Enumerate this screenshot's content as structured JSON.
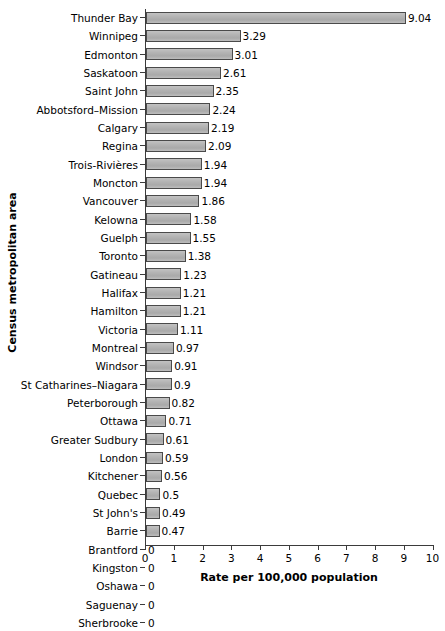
{
  "chart_data": {
    "type": "bar",
    "orientation": "horizontal",
    "title": "",
    "xlabel": "Rate per 100,000 population",
    "ylabel": "Census metropolitan area",
    "xlim": [
      0,
      10
    ],
    "xticks": [
      0,
      1,
      2,
      3,
      4,
      5,
      6,
      7,
      8,
      9,
      10
    ],
    "xtick_labels": [
      "0",
      "1",
      "2",
      "3",
      "4",
      "5",
      "6",
      "7",
      "8",
      "9",
      "10"
    ],
    "grid": false,
    "legend": null,
    "bar_color": "#b0b0b0",
    "bar_edge_color": "#4a4a4a",
    "categories": [
      "Thunder Bay",
      "Winnipeg",
      "Edmonton",
      "Saskatoon",
      "Saint John",
      "Abbotsford–Mission",
      "Calgary",
      "Regina",
      "Trois-Rivières",
      "Moncton",
      "Vancouver",
      "Kelowna",
      "Guelph",
      "Toronto",
      "Gatineau",
      "Halifax",
      "Hamilton",
      "Victoria",
      "Montreal",
      "Windsor",
      "St Catharines–Niagara",
      "Peterborough",
      "Ottawa",
      "Greater Sudbury",
      "London",
      "Kitchener",
      "Quebec",
      "St John's",
      "Barrie",
      "Brantford",
      "Kingston",
      "Oshawa",
      "Saguenay",
      "Sherbrooke"
    ],
    "values": [
      9.04,
      3.29,
      3.01,
      2.61,
      2.35,
      2.24,
      2.19,
      2.09,
      1.94,
      1.94,
      1.86,
      1.58,
      1.55,
      1.38,
      1.23,
      1.21,
      1.21,
      1.11,
      0.97,
      0.91,
      0.9,
      0.82,
      0.71,
      0.61,
      0.59,
      0.56,
      0.5,
      0.49,
      0.47,
      0,
      0,
      0,
      0,
      0
    ],
    "value_labels": [
      "9.04",
      "3.29",
      "3.01",
      "2.61",
      "2.35",
      "2.24",
      "2.19",
      "2.09",
      "1.94",
      "1.94",
      "1.86",
      "1.58",
      "1.55",
      "1.38",
      "1.23",
      "1.21",
      "1.21",
      "1.11",
      "0.97",
      "0.91",
      "0.9",
      "0.82",
      "0.71",
      "0.61",
      "0.59",
      "0.56",
      "0.5",
      "0.49",
      "0.47",
      "0",
      "0",
      "0",
      "0",
      "0"
    ]
  }
}
